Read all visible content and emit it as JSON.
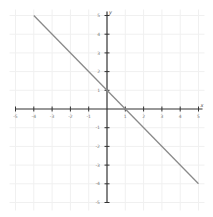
{
  "chart_data": {
    "type": "line",
    "title": "",
    "xlabel": "x",
    "ylabel": "y",
    "xlim": [
      -5,
      5
    ],
    "ylim": [
      -5,
      5
    ],
    "grid": true,
    "legend": null,
    "x_ticks": [
      -5,
      -4,
      -3,
      -2,
      -1,
      1,
      2,
      3,
      4,
      5
    ],
    "y_ticks": [
      5,
      4,
      3,
      2,
      1,
      -1,
      -2,
      -3,
      -4,
      -5
    ],
    "series": [
      {
        "name": "y = -x + 1",
        "color": "#8a8a8a",
        "x": [
          -4,
          5
        ],
        "y": [
          5,
          -4
        ]
      }
    ]
  },
  "layout": {
    "origin_px": [
      107,
      109
    ],
    "unit_x_px": 18.3,
    "unit_y_px": 18.7
  }
}
